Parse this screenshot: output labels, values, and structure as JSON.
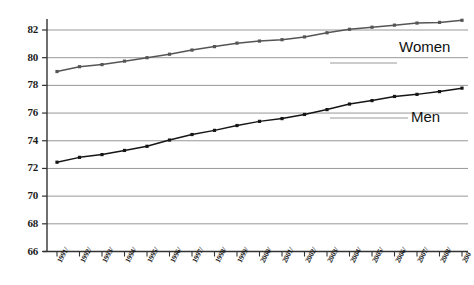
{
  "chart_data": {
    "type": "line",
    "title": "",
    "subtitle": "",
    "xlabel": "",
    "ylabel": "",
    "xlim": [
      0,
      18
    ],
    "ylim": [
      66,
      83.2
    ],
    "yticks": [
      66,
      68,
      70,
      72,
      74,
      76,
      78,
      80,
      82
    ],
    "grid": true,
    "grid_axis": "y",
    "legend": "inline-annotations",
    "categories": [
      "1991/",
      "1992/",
      "1993/",
      "1994/",
      "1995/",
      "1996/",
      "1997/",
      "1998/",
      "1999/",
      "2000/",
      "2001/",
      "2002/",
      "2003/",
      "2004/",
      "2005/",
      "2006/",
      "2007/",
      "2008/",
      "200"
    ],
    "series": [
      {
        "name": "Women",
        "color": "#555555",
        "values": [
          79.0,
          79.35,
          79.5,
          79.75,
          80.0,
          80.25,
          80.55,
          80.8,
          81.05,
          81.2,
          81.3,
          81.5,
          81.8,
          82.05,
          82.2,
          82.35,
          82.5,
          82.55,
          82.7
        ]
      },
      {
        "name": "Men",
        "color": "#161616",
        "values": [
          72.45,
          72.8,
          73.0,
          73.3,
          73.6,
          74.05,
          74.45,
          74.75,
          75.1,
          75.4,
          75.6,
          75.9,
          76.25,
          76.65,
          76.9,
          77.2,
          77.35,
          77.55,
          77.8
        ]
      }
    ],
    "annotations": [
      {
        "text": "Women",
        "series": "Women"
      },
      {
        "text": "Men",
        "series": "Men"
      }
    ]
  },
  "axis": {
    "y_tick_labels": [
      "82",
      "80",
      "78",
      "76",
      "74",
      "72",
      "70",
      "68",
      "66"
    ],
    "x_tick_labels": [
      "1991/",
      "1992/",
      "1993/",
      "1994/",
      "1995/",
      "1996/",
      "1997/",
      "1998/",
      "1999/",
      "2000/",
      "2001/",
      "2002/",
      "2003/",
      "2004/",
      "2005/",
      "2006/",
      "2007/",
      "2008/",
      "200"
    ]
  },
  "labels": {
    "women": "Women",
    "men": "Men"
  },
  "colors": {
    "women_line": "#555555",
    "men_line": "#161616",
    "grid": "#8c8c8c",
    "axis": "#333333",
    "background": "#ffffff"
  }
}
